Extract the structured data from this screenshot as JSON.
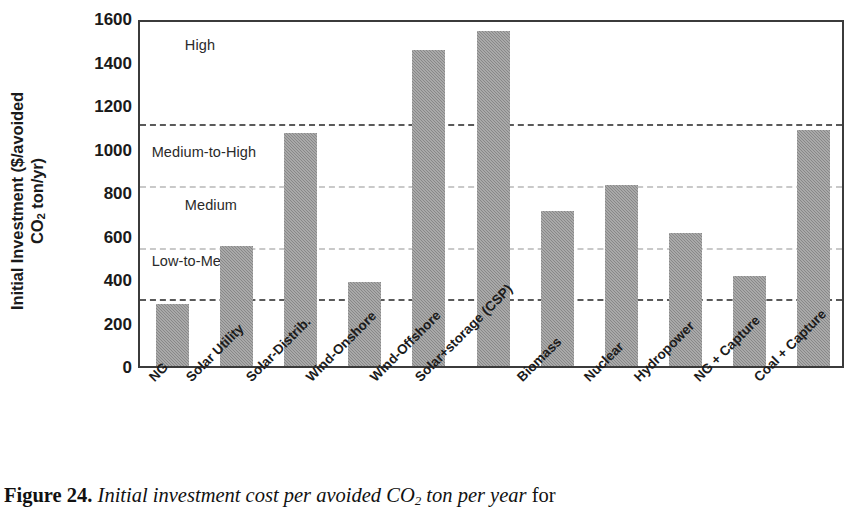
{
  "chart_data": {
    "type": "bar",
    "title": "",
    "xlabel": "",
    "ylabel_line1": "Initial Investment ($/avoided",
    "ylabel_line2_pre": "CO",
    "ylabel_line2_sub": "2",
    "ylabel_line2_post": " ton/yr)",
    "ylim": [
      0,
      1600
    ],
    "yticks": [
      1600,
      1400,
      1200,
      1000,
      800,
      600,
      400,
      200,
      0
    ],
    "grid": false,
    "categories": [
      "NG",
      "Solar Utility",
      "Solar-Distrib.",
      "Wind-Onshore",
      "Wind-Offshore",
      "Solar+storage (CSP)",
      "Biomass",
      "Nuclear",
      "Hydropower",
      "NG + Capture",
      "Coal + Capture"
    ],
    "values": [
      285,
      550,
      1070,
      385,
      1455,
      1540,
      715,
      830,
      610,
      415,
      1085
    ],
    "series_name": "Initial investment cost per avoided CO2 ton per year",
    "bar_color": "#8f8f8f",
    "threshold_lines": [
      {
        "label": "High-threshold",
        "value": 1130,
        "style": "dark"
      },
      {
        "label": "Medium-to-High-threshold",
        "value": 845,
        "style": "faint"
      },
      {
        "label": "Medium-threshold",
        "value": 560,
        "style": "faint"
      },
      {
        "label": "Low-to-Medium-threshold",
        "value": 325,
        "style": "dark"
      }
    ],
    "band_annotations": [
      {
        "text": "High",
        "value": 1490,
        "x_frac": 0.055
      },
      {
        "text": "Medium-to-High",
        "value": 1000,
        "x_frac": 0.008
      },
      {
        "text": "Medium",
        "value": 755,
        "x_frac": 0.055
      },
      {
        "text": "Low-to-Medium",
        "value": 495,
        "x_frac": 0.008
      },
      {
        "text": "Low",
        "value": 290,
        "x_frac": 0.105
      }
    ]
  },
  "caption": {
    "figure_number": "Figure 24",
    "separator": ". ",
    "text_pre": "Initial investment cost per avoided CO",
    "text_sub": "2",
    "text_post": " ton per year",
    "text_tail": " for"
  }
}
